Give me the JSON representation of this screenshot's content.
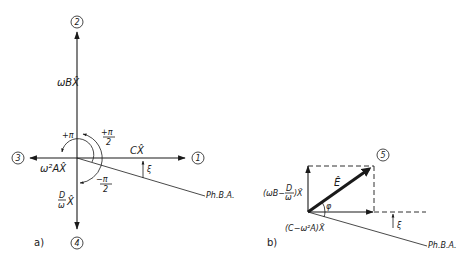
{
  "diagram_a": {
    "panel_label": "a)",
    "axis_markers": [
      "1",
      "2",
      "3",
      "4"
    ],
    "labels": {
      "up_vector": "ωBX̂",
      "right_vector": "CX̂",
      "left_vector": "ω²AX̂",
      "down_vector_num": "D",
      "down_vector_den": "ω",
      "down_vector_tail": "X̂",
      "angle_plus_pi": "+π",
      "angle_plus_pi2_num": "+π",
      "angle_plus_pi2_den": "2",
      "angle_minus_pi2_num": "−π",
      "angle_minus_pi2_den": "2",
      "angle_xi": "ξ",
      "reference_line": "Ph.B.A."
    }
  },
  "diagram_b": {
    "panel_label": "b)",
    "axis_marker": "5",
    "labels": {
      "vertical_component_pre": "(ωB−",
      "vertical_component_num": "D",
      "vertical_component_den": "ω",
      "vertical_component_post": ")X̂",
      "horizontal_component": "(C−ω²A)X̂",
      "resultant": "Ê",
      "angle_phi": "φ",
      "angle_xi": "ξ",
      "reference_line": "Ph.B.A."
    }
  },
  "colors": {
    "ink": "#1a1a1a",
    "background": "#ffffff"
  }
}
